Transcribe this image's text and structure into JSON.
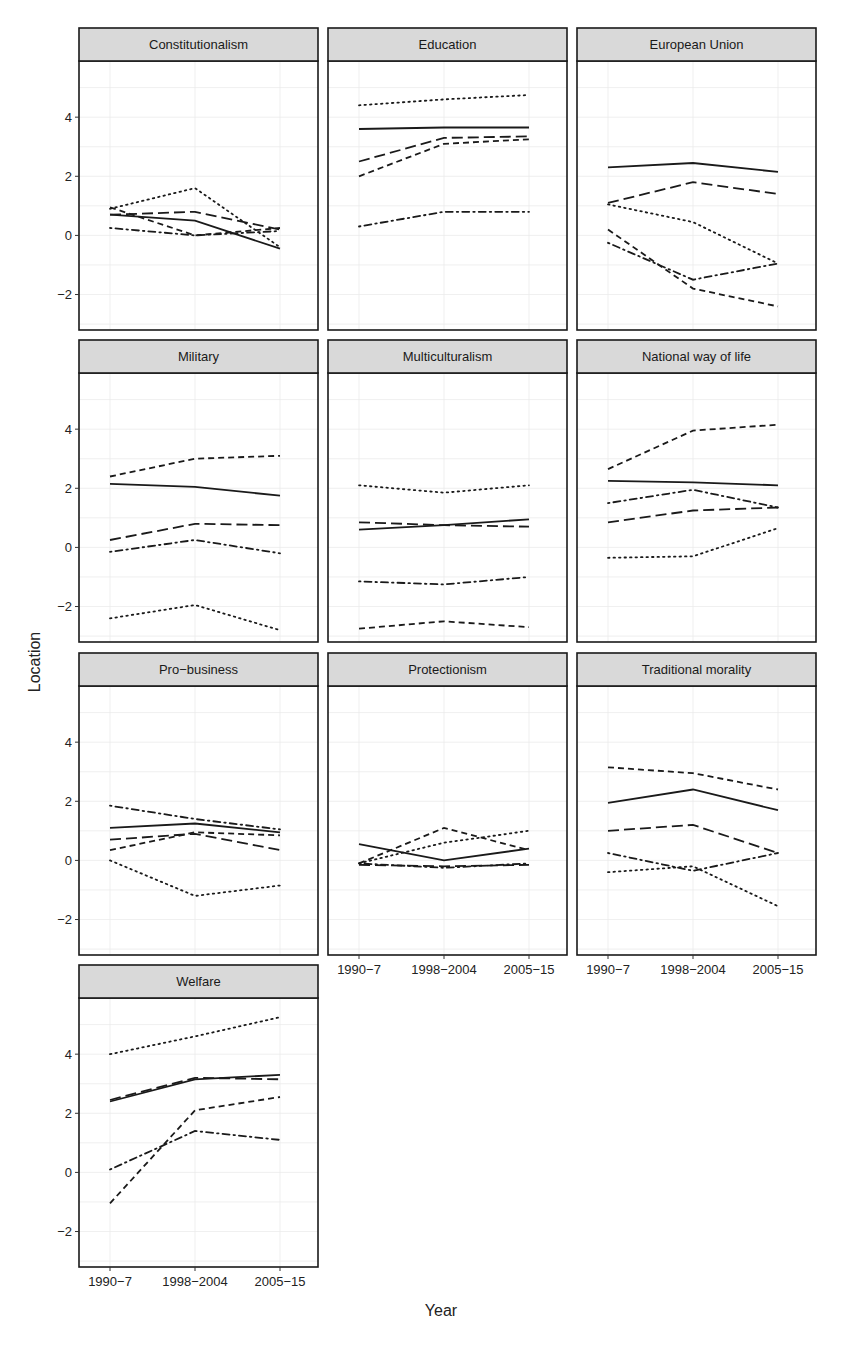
{
  "chart_data": {
    "type": "line",
    "layout": "facet_wrap",
    "ncol": 3,
    "xlabel": "Year",
    "ylabel": "Location",
    "x": [
      "1990-7",
      "1998-2004",
      "2005-15"
    ],
    "x_tick_labels": [
      "1990−7",
      "1998−2004",
      "2005−15"
    ],
    "y_ticks": [
      4,
      2,
      0,
      -2
    ],
    "y_tick_labels": [
      "4",
      "2",
      "0",
      "−2"
    ],
    "ylim": [
      -3.2,
      5.9
    ],
    "grid": true,
    "legend": "none",
    "line_types": [
      "solid",
      "longdash",
      "dashed",
      "dotted",
      "dotdash"
    ],
    "panels": [
      {
        "title": "Constitutionalism",
        "series": [
          {
            "linetype": "solid",
            "values": [
              0.7,
              0.5,
              -0.45
            ]
          },
          {
            "linetype": "longdash",
            "values": [
              0.7,
              0.8,
              0.2
            ]
          },
          {
            "linetype": "dashed",
            "values": [
              0.95,
              0.0,
              0.25
            ]
          },
          {
            "linetype": "dotted",
            "values": [
              0.9,
              1.6,
              -0.4
            ]
          },
          {
            "linetype": "dotdash",
            "values": [
              0.25,
              0.0,
              0.15
            ]
          }
        ]
      },
      {
        "title": "Education",
        "series": [
          {
            "linetype": "solid",
            "values": [
              3.6,
              3.65,
              3.65
            ]
          },
          {
            "linetype": "longdash",
            "values": [
              2.5,
              3.3,
              3.35
            ]
          },
          {
            "linetype": "dashed",
            "values": [
              2.0,
              3.1,
              3.25
            ]
          },
          {
            "linetype": "dotted",
            "values": [
              4.4,
              4.6,
              4.75
            ]
          },
          {
            "linetype": "dotdash",
            "values": [
              0.3,
              0.8,
              0.8
            ]
          }
        ]
      },
      {
        "title": "European Union",
        "series": [
          {
            "linetype": "solid",
            "values": [
              2.3,
              2.45,
              2.15
            ]
          },
          {
            "linetype": "longdash",
            "values": [
              1.1,
              1.8,
              1.4
            ]
          },
          {
            "linetype": "dashed",
            "values": [
              0.2,
              -1.8,
              -2.4
            ]
          },
          {
            "linetype": "dotted",
            "values": [
              1.05,
              0.45,
              -0.95
            ]
          },
          {
            "linetype": "dotdash",
            "values": [
              -0.25,
              -1.5,
              -0.95
            ]
          }
        ]
      },
      {
        "title": "Military",
        "series": [
          {
            "linetype": "solid",
            "values": [
              2.15,
              2.05,
              1.75
            ]
          },
          {
            "linetype": "longdash",
            "values": [
              0.25,
              0.8,
              0.75
            ]
          },
          {
            "linetype": "dashed",
            "values": [
              2.4,
              3.0,
              3.1
            ]
          },
          {
            "linetype": "dotted",
            "values": [
              -2.4,
              -1.95,
              -2.8
            ]
          },
          {
            "linetype": "dotdash",
            "values": [
              -0.15,
              0.25,
              -0.2
            ]
          }
        ]
      },
      {
        "title": "Multiculturalism",
        "series": [
          {
            "linetype": "solid",
            "values": [
              0.6,
              0.75,
              0.95
            ]
          },
          {
            "linetype": "longdash",
            "values": [
              0.85,
              0.75,
              0.7
            ]
          },
          {
            "linetype": "dashed",
            "values": [
              -2.75,
              -2.5,
              -2.7
            ]
          },
          {
            "linetype": "dotted",
            "values": [
              2.1,
              1.85,
              2.1
            ]
          },
          {
            "linetype": "dotdash",
            "values": [
              -1.15,
              -1.25,
              -1.0
            ]
          }
        ]
      },
      {
        "title": "National way of life",
        "series": [
          {
            "linetype": "solid",
            "values": [
              2.25,
              2.2,
              2.1
            ]
          },
          {
            "linetype": "longdash",
            "values": [
              0.85,
              1.25,
              1.35
            ]
          },
          {
            "linetype": "dashed",
            "values": [
              2.65,
              3.95,
              4.15
            ]
          },
          {
            "linetype": "dotted",
            "values": [
              -0.35,
              -0.3,
              0.65
            ]
          },
          {
            "linetype": "dotdash",
            "values": [
              1.5,
              1.95,
              1.35
            ]
          }
        ]
      },
      {
        "title": "Pro−business",
        "series": [
          {
            "linetype": "solid",
            "values": [
              1.1,
              1.25,
              0.95
            ]
          },
          {
            "linetype": "longdash",
            "values": [
              0.7,
              0.9,
              0.35
            ]
          },
          {
            "linetype": "dashed",
            "values": [
              0.35,
              0.95,
              0.85
            ]
          },
          {
            "linetype": "dotted",
            "values": [
              0.0,
              -1.2,
              -0.85
            ]
          },
          {
            "linetype": "dotdash",
            "values": [
              1.85,
              1.4,
              1.05
            ]
          }
        ]
      },
      {
        "title": "Protectionism",
        "series": [
          {
            "linetype": "solid",
            "values": [
              0.55,
              0.0,
              0.4
            ]
          },
          {
            "linetype": "longdash",
            "values": [
              -0.15,
              -0.2,
              -0.15
            ]
          },
          {
            "linetype": "dashed",
            "values": [
              -0.1,
              1.1,
              0.35
            ]
          },
          {
            "linetype": "dotted",
            "values": [
              -0.1,
              0.6,
              1.0
            ]
          },
          {
            "linetype": "dotdash",
            "values": [
              -0.1,
              -0.25,
              -0.1
            ]
          }
        ]
      },
      {
        "title": "Traditional morality",
        "series": [
          {
            "linetype": "solid",
            "values": [
              1.95,
              2.4,
              1.7
            ]
          },
          {
            "linetype": "longdash",
            "values": [
              1.0,
              1.2,
              0.25
            ]
          },
          {
            "linetype": "dashed",
            "values": [
              3.15,
              2.95,
              2.4
            ]
          },
          {
            "linetype": "dotted",
            "values": [
              -0.4,
              -0.2,
              -1.55
            ]
          },
          {
            "linetype": "dotdash",
            "values": [
              0.25,
              -0.35,
              0.25
            ]
          }
        ]
      },
      {
        "title": "Welfare",
        "series": [
          {
            "linetype": "solid",
            "values": [
              2.4,
              3.15,
              3.3
            ]
          },
          {
            "linetype": "longdash",
            "values": [
              2.45,
              3.2,
              3.15
            ]
          },
          {
            "linetype": "dashed",
            "values": [
              -1.05,
              2.1,
              2.55
            ]
          },
          {
            "linetype": "dotted",
            "values": [
              4.0,
              4.6,
              5.25
            ]
          },
          {
            "linetype": "dotdash",
            "values": [
              0.1,
              1.4,
              1.1
            ]
          }
        ]
      }
    ]
  },
  "colors": {
    "strip_fill": "#d9d9d9",
    "panel_border": "#1a1a1a",
    "grid": "#ebebeb",
    "line": "#1a1a1a"
  }
}
